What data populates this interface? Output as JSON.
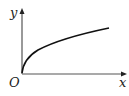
{
  "diagram": {
    "type": "function-graph",
    "labels": {
      "y_axis": "y",
      "x_axis": "x",
      "origin": "O"
    },
    "colors": {
      "axis": "#555555",
      "curve": "#111111",
      "text": "#222222"
    }
  }
}
